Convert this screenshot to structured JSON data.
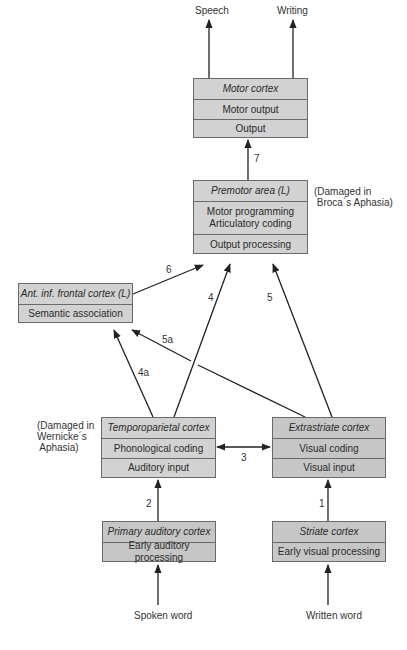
{
  "diagram": {
    "outputs": {
      "speech": "Speech",
      "writing": "Writing"
    },
    "inputs": {
      "spoken": "Spoken word",
      "written": "Written word"
    },
    "boxes": {
      "motor": {
        "title": "Motor cortex",
        "rows": [
          "Motor output",
          "Output"
        ]
      },
      "premotor": {
        "title": "Premotor area (L)",
        "rows": [
          "Motor programming\nArticulatory coding",
          "Output processing"
        ]
      },
      "frontal": {
        "title": "Ant. inf. frontal cortex (L)",
        "rows": [
          "Semantic association"
        ]
      },
      "temporoparietal": {
        "title": "Temporoparietal cortex",
        "rows": [
          "Phonological coding",
          "Auditory input"
        ]
      },
      "extrastriate": {
        "title": "Extrastriate  cortex",
        "rows": [
          "Visual coding",
          "Visual input"
        ]
      },
      "auditory": {
        "title": "Primary auditory cortex",
        "rows": [
          "Early auditory processing"
        ]
      },
      "striate": {
        "title": "Striate cortex",
        "rows": [
          "Early visual processing"
        ]
      }
    },
    "notes": {
      "broca": "(Damaged in\n Broca´s Aphasia)",
      "wernicke": "(Damaged in\nWernicke´s\n Aphasia)"
    },
    "pathways": {
      "p1": "1",
      "p2": "2",
      "p3": "3",
      "p4": "4",
      "p4a": "4a",
      "p5": "5",
      "p5a": "5a",
      "p6": "6",
      "p7": "7"
    }
  }
}
